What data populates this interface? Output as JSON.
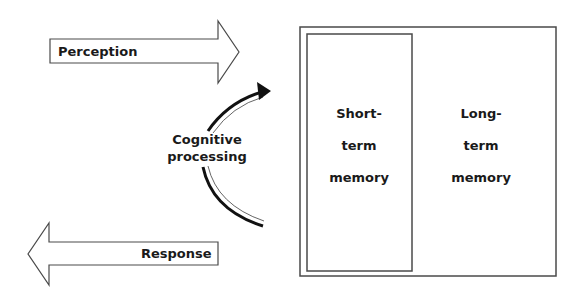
{
  "diagram": {
    "perception_arrow": {
      "label": "Perception",
      "direction": "right"
    },
    "response_arrow": {
      "label": "Response",
      "direction": "left"
    },
    "processing": {
      "line1": "Cognitive",
      "line2": "processing",
      "arrow": "curved-up-arrow"
    },
    "memory_container": {
      "short_term": {
        "line1": "Short-",
        "line2": "term",
        "line3": "memory"
      },
      "long_term": {
        "line1": "Long-",
        "line2": "term",
        "line3": "memory"
      }
    },
    "colors": {
      "stroke": "#4a4a4a",
      "text": "#1a1a1a",
      "curve": "#111111"
    }
  }
}
